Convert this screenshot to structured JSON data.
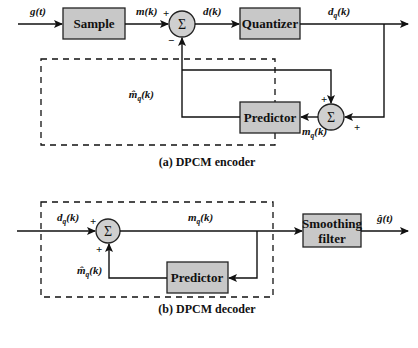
{
  "encoder": {
    "caption": "(a) DPCM encoder",
    "blocks": {
      "sample": "Sample",
      "quantizer": "Quantizer",
      "predictor": "Predictor"
    },
    "summer_symbol": "Σ",
    "signals": {
      "input": "g(t)",
      "sampled": "m(k)",
      "difference": "d(k)",
      "quantized": {
        "base": "d",
        "sub": "q",
        "arg": "(k)"
      },
      "reconstructed": {
        "base": "m",
        "sub": "q",
        "arg": "(k)"
      },
      "predicted": {
        "base": "m̂",
        "sub": "q",
        "arg": "(k)"
      }
    },
    "signs": {
      "sum1_top": "+",
      "sum1_bottom": "−",
      "sum2_top": "+",
      "sum2_right": "+"
    }
  },
  "decoder": {
    "caption": "(b) DPCM decoder",
    "blocks": {
      "predictor": "Predictor",
      "smoothing_line1": "Smoothing",
      "smoothing_line2": "filter"
    },
    "summer_symbol": "Σ",
    "signals": {
      "input": {
        "base": "d",
        "sub": "q",
        "arg": "(k)"
      },
      "reconstructed": {
        "base": "m",
        "sub": "q",
        "arg": "(k)"
      },
      "predicted": {
        "base": "m̂",
        "sub": "q",
        "arg": "(k)"
      },
      "output": "ĝ(t)"
    },
    "signs": {
      "sum_left": "+",
      "sum_bottom": "+"
    }
  }
}
